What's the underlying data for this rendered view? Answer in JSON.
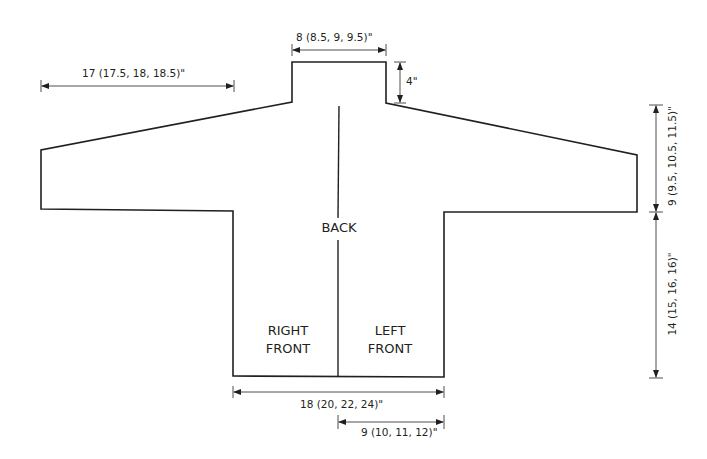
{
  "diagram": {
    "type": "knitting-schematic",
    "garment": "cardigan",
    "colors": {
      "outline": "#231f20",
      "dimension_line": "#231f20",
      "background": "#ffffff"
    },
    "pieces": {
      "back": "BACK",
      "right_front_line1": "RIGHT",
      "right_front_line2": "FRONT",
      "left_front_line1": "LEFT",
      "left_front_line2": "FRONT"
    },
    "dimensions": {
      "neck_width": "8 (8.5, 9, 9.5)\"",
      "neck_depth": "4\"",
      "sleeve_length": "17 (17.5, 18, 18.5)\"",
      "armhole_depth": "9 (9.5, 10.5, 11.5)\"",
      "body_length": "14 (15, 16, 16)\"",
      "body_width": "18 (20, 22, 24)\"",
      "front_width": "9 (10, 11, 12)\""
    }
  }
}
